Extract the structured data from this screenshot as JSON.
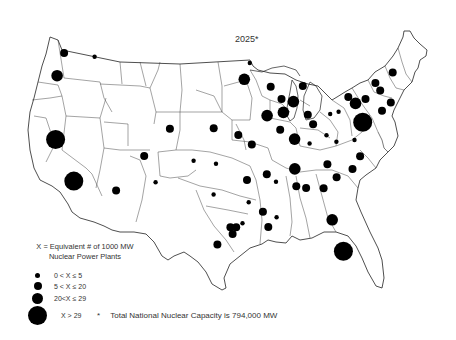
{
  "title": "2025*",
  "legend": {
    "heading_line1": "X = Equivalent # of 1000 MW",
    "heading_line2": "Nuclear Power Plants",
    "classes": [
      {
        "label": "0 < X ≤ 5",
        "size": "xs"
      },
      {
        "label": "5 < X ≤ 20",
        "size": "s"
      },
      {
        "label": "20<X ≤ 29",
        "size": "m"
      },
      {
        "label": "X > 29",
        "size": "l"
      }
    ]
  },
  "footnote": {
    "star": "*",
    "text": "Total National Nuclear Capacity is 794,000 MW"
  },
  "sites": [
    {
      "region": "Puget Sound",
      "lon": -122.3,
      "lat": 47.6,
      "size": "s"
    },
    {
      "region": "Eastern Washington",
      "lon": -117.4,
      "lat": 47.4,
      "size": "xs"
    },
    {
      "region": "Oregon",
      "lon": -122.9,
      "lat": 45.2,
      "size": "m"
    },
    {
      "region": "Northern California",
      "lon": -121.8,
      "lat": 38.6,
      "size": "l"
    },
    {
      "region": "Southern California",
      "lon": -118.4,
      "lat": 34.4,
      "size": "l"
    },
    {
      "region": "Arizona",
      "lon": -112.2,
      "lat": 33.6,
      "size": "s"
    },
    {
      "region": "Colorado West",
      "lon": -108.5,
      "lat": 37.3,
      "size": "s"
    },
    {
      "region": "Colorado Front Range",
      "lon": -104.9,
      "lat": 40.2,
      "size": "s"
    },
    {
      "region": "Kansas",
      "lon": -98.3,
      "lat": 40.3,
      "size": "s"
    },
    {
      "region": "Iowa West",
      "lon": -94.6,
      "lat": 39.6,
      "size": "s"
    },
    {
      "region": "Missouri",
      "lon": -92.6,
      "lat": 38.6,
      "size": "s"
    },
    {
      "region": "Eastern Kansas",
      "lon": -101.2,
      "lat": 36.9,
      "size": "xs"
    },
    {
      "region": "New Mexico",
      "lon": -106.6,
      "lat": 34.6,
      "size": "xs"
    },
    {
      "region": "Oklahoma",
      "lon": -97.9,
      "lat": 36.6,
      "size": "xs"
    },
    {
      "region": "North Texas",
      "lon": -98.2,
      "lat": 33.4,
      "size": "xs"
    },
    {
      "region": "Arkansas West",
      "lon": -93.4,
      "lat": 34.9,
      "size": "s"
    },
    {
      "region": "East Texas",
      "lon": -93.2,
      "lat": 32.6,
      "size": "xs"
    },
    {
      "region": "Houston West",
      "lon": -95.8,
      "lat": 30.0,
      "size": "s"
    },
    {
      "region": "Houston East",
      "lon": -95.0,
      "lat": 30.0,
      "size": "s"
    },
    {
      "region": "Beaumont",
      "lon": -94.1,
      "lat": 30.4,
      "size": "xs"
    },
    {
      "region": "Galveston",
      "lon": -95.5,
      "lat": 29.3,
      "size": "s"
    },
    {
      "region": "South Texas",
      "lon": -97.6,
      "lat": 28.2,
      "size": "s"
    },
    {
      "region": "Louisiana",
      "lon": -91.2,
      "lat": 31.6,
      "size": "s"
    },
    {
      "region": "New Orleans",
      "lon": -90.5,
      "lat": 30.0,
      "size": "s"
    },
    {
      "region": "Mississippi",
      "lon": -89.3,
      "lat": 31.0,
      "size": "xs"
    },
    {
      "region": "Arkansas East",
      "lon": -90.5,
      "lat": 35.5,
      "size": "s"
    },
    {
      "region": "Tennessee West",
      "lon": -89.2,
      "lat": 34.7,
      "size": "xs"
    },
    {
      "region": "Minnesota",
      "lon": -93.6,
      "lat": 45.4,
      "size": "m"
    },
    {
      "region": "Minnesota North",
      "lon": -92.7,
      "lat": 47.1,
      "size": "xs"
    },
    {
      "region": "Wisconsin",
      "lon": -89.5,
      "lat": 44.6,
      "size": "s"
    },
    {
      "region": "Illinois North",
      "lon": -90.2,
      "lat": 41.6,
      "size": "m"
    },
    {
      "region": "Chicago",
      "lon": -87.7,
      "lat": 41.9,
      "size": "m"
    },
    {
      "region": "Lake Michigan West",
      "lon": -87.9,
      "lat": 43.3,
      "size": "s"
    },
    {
      "region": "Western Michigan",
      "lon": -86.1,
      "lat": 43.0,
      "size": "m"
    },
    {
      "region": "Northern Michigan",
      "lon": -84.5,
      "lat": 44.6,
      "size": "s"
    },
    {
      "region": "Illinois Central",
      "lon": -88.3,
      "lat": 40.1,
      "size": "s"
    },
    {
      "region": "Indiana",
      "lon": -86.2,
      "lat": 39.1,
      "size": "m"
    },
    {
      "region": "Ohio West",
      "lon": -84.0,
      "lat": 41.6,
      "size": "s"
    },
    {
      "region": "Ohio Central",
      "lon": -83.3,
      "lat": 40.6,
      "size": "s"
    },
    {
      "region": "Kentucky",
      "lon": -84.0,
      "lat": 38.6,
      "size": "xs"
    },
    {
      "region": "West Virginia",
      "lon": -81.4,
      "lat": 39.4,
      "size": "xs"
    },
    {
      "region": "Pennsylvania West",
      "lon": -79.3,
      "lat": 41.8,
      "size": "xs"
    },
    {
      "region": "Erie",
      "lon": -80.6,
      "lat": 41.6,
      "size": "xs"
    },
    {
      "region": "Virginia West",
      "lon": -80.0,
      "lat": 38.7,
      "size": "xs"
    },
    {
      "region": "Tennessee",
      "lon": -86.4,
      "lat": 36.0,
      "size": "m"
    },
    {
      "region": "Alabama North",
      "lon": -86.3,
      "lat": 34.2,
      "size": "s"
    },
    {
      "region": "Georgia West",
      "lon": -84.9,
      "lat": 34.0,
      "size": "s"
    },
    {
      "region": "Georgia East",
      "lon": -82.4,
      "lat": 33.9,
      "size": "s"
    },
    {
      "region": "North Carolina West",
      "lon": -81.6,
      "lat": 36.4,
      "size": "s"
    },
    {
      "region": "South Carolina",
      "lon": -80.4,
      "lat": 35.0,
      "size": "s"
    },
    {
      "region": "North Carolina East",
      "lon": -78.0,
      "lat": 35.8,
      "size": "s"
    },
    {
      "region": "Jacksonville",
      "lon": -81.5,
      "lat": 30.6,
      "size": "m"
    },
    {
      "region": "South Florida",
      "lon": -80.3,
      "lat": 27.3,
      "size": "l"
    },
    {
      "region": "Virginia",
      "lon": -76.7,
      "lat": 37.1,
      "size": "s"
    },
    {
      "region": "Maryland",
      "lon": -77.3,
      "lat": 38.8,
      "size": "xs"
    },
    {
      "region": "New Jersey / PA",
      "lon": -75.8,
      "lat": 40.6,
      "size": "l"
    },
    {
      "region": "New York Central",
      "lon": -76.6,
      "lat": 42.6,
      "size": "m"
    },
    {
      "region": "Western New York",
      "lon": -77.6,
      "lat": 43.3,
      "size": "s"
    },
    {
      "region": "Upstate New York",
      "lon": -75.0,
      "lat": 43.0,
      "size": "s"
    },
    {
      "region": "Vermont",
      "lon": -73.2,
      "lat": 44.6,
      "size": "s"
    },
    {
      "region": "New Hampshire",
      "lon": -72.6,
      "lat": 43.8,
      "size": "s"
    },
    {
      "region": "Maine",
      "lon": -70.3,
      "lat": 45.6,
      "size": "s"
    },
    {
      "region": "Massachusetts",
      "lon": -71.2,
      "lat": 42.5,
      "size": "s"
    },
    {
      "region": "Connecticut",
      "lon": -72.7,
      "lat": 41.7,
      "size": "s"
    }
  ]
}
